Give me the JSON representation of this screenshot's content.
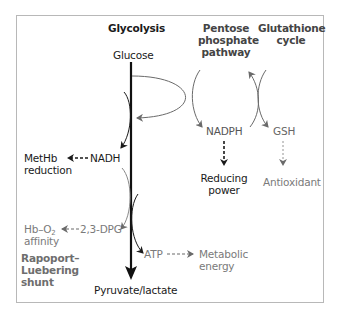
{
  "headers": {
    "glycolysis": "Glycolysis",
    "pentose_line1": "Pentose",
    "pentose_line2": "phosphate",
    "pentose_line3": "pathway",
    "glutathione_line1": "Glutathione",
    "glutathione_line2": "cycle"
  },
  "nodes": {
    "glucose": "Glucose",
    "nadph": "NADPH",
    "gsh": "GSH",
    "nadh": "NADH",
    "dpg": "2,3-DPG",
    "atp": "ATP",
    "pyruvate": "Pyruvate/lactate"
  },
  "outcomes": {
    "methb_line1": "MetHb",
    "methb_line2": "reduction",
    "reducing_line1": "Reducing",
    "reducing_line2": "power",
    "antioxidant": "Antioxidant",
    "hbo2_prefix": "Hb–O",
    "hbo2_sub": "2",
    "hbo2_line2": "affinity",
    "metabolic_line1": "Metabolic",
    "metabolic_line2": "energy"
  },
  "shunt": {
    "line1": "Rapoport–",
    "line2": "Luebering",
    "line3": "shunt"
  },
  "colors": {
    "dark": "#1a1a1a",
    "gray": "#7a7a7a",
    "frame": "#b8b8b8"
  }
}
